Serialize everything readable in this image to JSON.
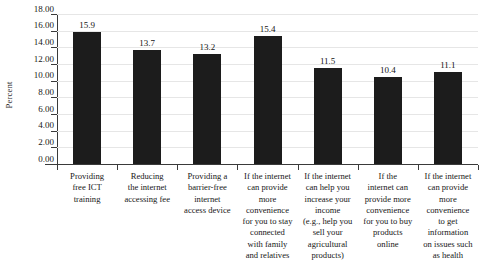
{
  "chart_data": {
    "type": "bar",
    "title": "",
    "xlabel": "",
    "ylabel": "Percent",
    "ylim": [
      0,
      18
    ],
    "ytick_step": 2,
    "grid": true,
    "legend": "none",
    "bar_color": "#1c1c1c",
    "gridline_color": "#e6e6e6",
    "axis_color": "#3a3a3a",
    "ytick_labels": [
      "0.00",
      "2.00",
      "4.00",
      "6.00",
      "8.00",
      "10.00",
      "12.00",
      "14.00",
      "16.00",
      "18.00"
    ],
    "ytick_values": [
      0,
      2,
      4,
      6,
      8,
      10,
      12,
      14,
      16,
      18
    ],
    "categories": [
      "Providing free ICT training",
      "Reducing the internet accessing fee",
      "Providing a barrier-free internet access device",
      "If the internet can provide more convenience for you to stay connected with family and relatives",
      "If the internet can help you increase your income (e.g., help you sell your agricultural products)",
      "If the internet can provide more convenience for you to buy products online",
      "If the internet can provide more convenience to get information on issues such as health"
    ],
    "category_lines": [
      [
        "Providing",
        "free ICT",
        "training"
      ],
      [
        "Reducing",
        "the internet",
        "accessing fee"
      ],
      [
        "Providing a",
        "barrier-free",
        "internet",
        "access device"
      ],
      [
        "If the internet",
        "can provide",
        "more",
        "convenience",
        "for you to stay",
        "connected",
        "with family",
        "and relatives"
      ],
      [
        "If the internet",
        "can help you",
        "increase your",
        "income",
        "(e.g., help you",
        "sell your",
        "agricultural",
        "products)"
      ],
      [
        "If the",
        "internet can",
        "provide more",
        "convenience",
        "for you to buy",
        "products",
        "online"
      ],
      [
        "If the internet",
        "can provide",
        "more",
        "convenience",
        "to get",
        "information",
        "on issues such",
        "as health"
      ]
    ],
    "values": [
      15.9,
      13.7,
      13.2,
      15.4,
      11.5,
      10.4,
      11.1
    ],
    "value_labels": [
      "15.9",
      "13.7",
      "13.2",
      "15.4",
      "11.5",
      "10.4",
      "11.1"
    ]
  }
}
